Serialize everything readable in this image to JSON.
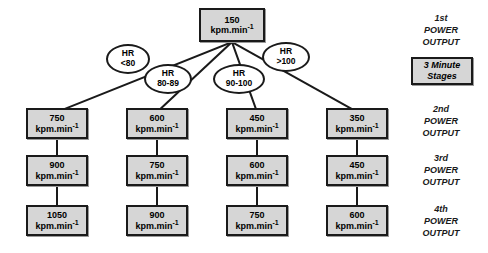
{
  "diagram": {
    "unit_label": "kpm.min",
    "unit_exponent": "-1",
    "colors": {
      "node_fill": "#d6d6d6",
      "node_border": "#1a1a1a",
      "oval_fill": "#ffffff",
      "background": "#ffffff"
    },
    "root": {
      "value": "150",
      "unit": "kpm.min",
      "exponent": "-1"
    },
    "decisions": [
      {
        "line1": "HR",
        "line2": "<80"
      },
      {
        "line1": "HR",
        "line2": "80-89"
      },
      {
        "line1": "HR",
        "line2": "90-100"
      },
      {
        "line1": "HR",
        "line2": ">100"
      }
    ],
    "columns": [
      {
        "stage2": "750",
        "stage3": "900",
        "stage4": "1050"
      },
      {
        "stage2": "600",
        "stage3": "750",
        "stage4": "900"
      },
      {
        "stage2": "450",
        "stage3": "600",
        "stage4": "750"
      },
      {
        "stage2": "350",
        "stage3": "450",
        "stage4": "600"
      }
    ],
    "stage_labels": [
      {
        "ordinal": "1st",
        "line2": "POWER",
        "line3": "OUTPUT"
      },
      {
        "ordinal": "2nd",
        "line2": "POWER",
        "line3": "OUTPUT"
      },
      {
        "ordinal": "3rd",
        "line2": "POWER",
        "line3": "OUTPUT"
      },
      {
        "ordinal": "4th",
        "line2": "POWER",
        "line3": "OUTPUT"
      }
    ],
    "stages_box": {
      "line1": "3 Minute",
      "line2": "Stages"
    }
  }
}
